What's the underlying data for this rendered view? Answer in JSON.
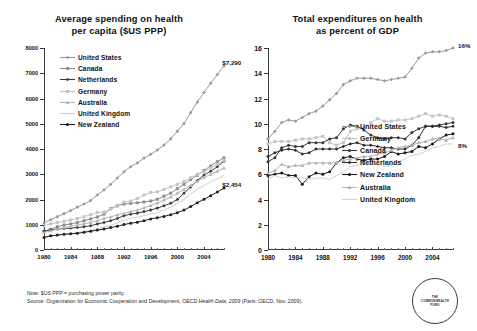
{
  "footnote": {
    "note": "Note: $US PPP = purchasing power parity.",
    "source_prefix": "Source: Organization for Economic Cooperation and Development, ",
    "source_italic": "OECD Health Data, 2009",
    "source_suffix": " (Paris: OECD, Nov. 2009)."
  },
  "logo": {
    "line1": "THE",
    "line2": "COMMONWEALTH",
    "line3": "FUND"
  },
  "chart_data": [
    {
      "id": "left",
      "type": "line",
      "title_line1": "Average spending on health",
      "title_line2": "per capita ($US PPP)",
      "xlabel": "",
      "ylabel": "",
      "xlim": [
        1980,
        2007
      ],
      "ylim": [
        0,
        8000
      ],
      "ytick_values": [
        0,
        1000,
        2000,
        3000,
        4000,
        5000,
        6000,
        7000,
        8000
      ],
      "ytick_labels": [
        "0",
        "1000",
        "2000",
        "3000",
        "4000",
        "5000",
        "6000",
        "7000",
        "8000"
      ],
      "xtick_values": [
        1980,
        1984,
        1988,
        1992,
        1996,
        2000,
        2004
      ],
      "xtick_labels": [
        "1980",
        "1984",
        "1988",
        "1992",
        "1996",
        "2000",
        "2004"
      ],
      "grid": false,
      "legend_position": "upper-left-inside",
      "annotations": [
        {
          "text": "$7,290",
          "x": 2006,
          "y": 7290
        },
        {
          "text": "$2,454",
          "x": 2006,
          "y": 2454
        }
      ],
      "x": [
        1980,
        1981,
        1982,
        1983,
        1984,
        1985,
        1986,
        1987,
        1988,
        1989,
        1990,
        1991,
        1992,
        1993,
        1994,
        1995,
        1996,
        1997,
        1998,
        1999,
        2000,
        2001,
        2002,
        2003,
        2004,
        2005,
        2006,
        2007
      ],
      "series": [
        {
          "name": "United States",
          "color": "#9a9a9a",
          "marker": "diamond",
          "values": [
            1072,
            1200,
            1320,
            1440,
            1560,
            1700,
            1820,
            1960,
            2180,
            2380,
            2600,
            2850,
            3100,
            3300,
            3450,
            3640,
            3790,
            3960,
            4160,
            4400,
            4700,
            5010,
            5440,
            5860,
            6240,
            6600,
            6950,
            7290
          ]
        },
        {
          "name": "Canada",
          "color": "#8e8e8e",
          "marker": "square",
          "values": [
            745,
            820,
            920,
            990,
            1030,
            1090,
            1160,
            1230,
            1310,
            1420,
            1640,
            1750,
            1820,
            1850,
            1870,
            1900,
            1940,
            2010,
            2130,
            2250,
            2430,
            2600,
            2790,
            2960,
            3150,
            3330,
            3500,
            3650
          ]
        },
        {
          "name": "Netherlands",
          "color": "#3c3c3c",
          "marker": "diamond",
          "values": [
            740,
            790,
            830,
            850,
            870,
            890,
            920,
            960,
            1030,
            1090,
            1160,
            1250,
            1360,
            1420,
            1460,
            1520,
            1580,
            1660,
            1750,
            1850,
            2000,
            2250,
            2500,
            2750,
            2970,
            3120,
            3300,
            3520
          ]
        },
        {
          "name": "Germany",
          "color": "#c4c4c4",
          "marker": "square",
          "values": [
            960,
            1040,
            1090,
            1140,
            1190,
            1250,
            1320,
            1400,
            1490,
            1500,
            1620,
            1740,
            1900,
            1940,
            2040,
            2180,
            2280,
            2300,
            2400,
            2500,
            2600,
            2720,
            2860,
            3000,
            3100,
            3250,
            3400,
            3550
          ]
        },
        {
          "name": "Australia",
          "color": "#b5b5b5",
          "marker": "triangle",
          "values": [
            690,
            760,
            830,
            890,
            930,
            990,
            1040,
            1090,
            1160,
            1250,
            1310,
            1390,
            1450,
            1520,
            1580,
            1670,
            1760,
            1860,
            1980,
            2100,
            2250,
            2400,
            2560,
            2720,
            2870,
            3000,
            3120,
            3250
          ]
        },
        {
          "name": "United Kingdom",
          "color": "#cfcfcf",
          "marker": "none",
          "values": [
            470,
            540,
            580,
            620,
            660,
            690,
            730,
            790,
            850,
            910,
            980,
            1070,
            1180,
            1250,
            1300,
            1360,
            1420,
            1480,
            1580,
            1700,
            1840,
            2010,
            2220,
            2400,
            2560,
            2700,
            2820,
            2950
          ]
        },
        {
          "name": "New Zealand",
          "color": "#202020",
          "marker": "circle",
          "values": [
            500,
            560,
            590,
            620,
            640,
            660,
            700,
            740,
            790,
            830,
            890,
            940,
            1010,
            1060,
            1100,
            1160,
            1230,
            1280,
            1330,
            1400,
            1480,
            1580,
            1720,
            1870,
            2010,
            2150,
            2300,
            2454
          ]
        }
      ]
    },
    {
      "id": "right",
      "type": "line",
      "title_line1": "Total expenditures on health",
      "title_line2": "as percent of GDP",
      "xlabel": "",
      "ylabel": "",
      "xlim": [
        1980,
        2007
      ],
      "ylim": [
        0,
        16
      ],
      "ytick_values": [
        0,
        2,
        4,
        6,
        8,
        10,
        12,
        14,
        16
      ],
      "ytick_labels": [
        "0",
        "2",
        "4",
        "6",
        "8",
        "10",
        "12",
        "14",
        "16"
      ],
      "xtick_values": [
        1980,
        1984,
        1988,
        1992,
        1996,
        2000,
        2004
      ],
      "xtick_labels": [
        "1980",
        "1984",
        "1988",
        "1992",
        "1996",
        "2000",
        "2004"
      ],
      "grid": false,
      "legend_position": "lower-right-inside",
      "annotations": [
        {
          "text": "16%",
          "x": 2007,
          "y": 15.9
        },
        {
          "text": "8%",
          "x": 2007,
          "y": 8.0
        }
      ],
      "x": [
        1980,
        1981,
        1982,
        1983,
        1984,
        1985,
        1986,
        1987,
        1988,
        1989,
        1990,
        1991,
        1992,
        1993,
        1994,
        1995,
        1996,
        1997,
        1998,
        1999,
        2000,
        2001,
        2002,
        2003,
        2004,
        2005,
        2006,
        2007
      ],
      "series": [
        {
          "name": "United States",
          "color": "#9a9a9a",
          "marker": "diamond",
          "values": [
            8.8,
            9.4,
            10.1,
            10.3,
            10.2,
            10.5,
            10.8,
            11.0,
            11.4,
            11.9,
            12.4,
            13.1,
            13.4,
            13.6,
            13.6,
            13.6,
            13.5,
            13.4,
            13.5,
            13.6,
            13.7,
            14.4,
            15.2,
            15.6,
            15.7,
            15.7,
            15.8,
            16.0
          ]
        },
        {
          "name": "Germany",
          "color": "#c4c4c4",
          "marker": "square",
          "values": [
            8.4,
            8.6,
            8.6,
            8.6,
            8.7,
            8.8,
            8.8,
            8.9,
            9.0,
            8.5,
            8.3,
            8.5,
            9.4,
            9.6,
            9.7,
            10.1,
            10.4,
            10.2,
            10.2,
            10.3,
            10.3,
            10.4,
            10.6,
            10.8,
            10.6,
            10.7,
            10.6,
            10.4
          ]
        },
        {
          "name": "Canada",
          "color": "#3a3a3a",
          "marker": "circle",
          "values": [
            7.0,
            7.3,
            8.1,
            8.3,
            8.2,
            8.2,
            8.5,
            8.5,
            8.5,
            8.8,
            8.9,
            9.6,
            9.9,
            9.8,
            9.5,
            9.1,
            8.9,
            8.8,
            8.9,
            8.9,
            8.8,
            9.3,
            9.6,
            9.8,
            9.8,
            9.9,
            10.0,
            10.1
          ]
        },
        {
          "name": "Netherlands",
          "color": "#2e2e2e",
          "marker": "diamond",
          "values": [
            7.4,
            7.7,
            7.9,
            8.0,
            7.9,
            7.6,
            7.7,
            8.0,
            8.0,
            8.0,
            8.0,
            8.2,
            8.4,
            8.5,
            8.3,
            8.3,
            8.2,
            8.1,
            8.1,
            8.0,
            8.0,
            8.3,
            8.9,
            9.8,
            9.8,
            9.8,
            9.7,
            9.8
          ]
        },
        {
          "name": "New Zealand",
          "color": "#1a1a1a",
          "marker": "circle",
          "values": [
            5.9,
            6.0,
            6.1,
            5.9,
            5.9,
            5.2,
            5.8,
            6.1,
            6.0,
            6.2,
            6.9,
            7.3,
            7.4,
            7.2,
            7.1,
            7.2,
            7.2,
            7.4,
            7.8,
            7.6,
            7.7,
            7.8,
            8.2,
            8.1,
            8.4,
            8.8,
            9.1,
            9.2
          ]
        },
        {
          "name": "Australia",
          "color": "#b2b2b2",
          "marker": "triangle",
          "values": [
            6.1,
            6.3,
            6.8,
            6.6,
            6.7,
            6.7,
            6.9,
            6.9,
            6.9,
            6.9,
            6.9,
            7.1,
            7.2,
            7.3,
            7.4,
            7.4,
            7.6,
            7.7,
            7.9,
            8.1,
            8.2,
            8.3,
            8.5,
            8.6,
            8.8,
            8.8,
            8.7,
            8.9
          ]
        },
        {
          "name": "United Kingdom",
          "color": "#d2d2d2",
          "marker": "none",
          "values": [
            5.6,
            5.9,
            5.7,
            5.8,
            5.7,
            5.7,
            5.6,
            5.7,
            5.7,
            5.6,
            5.9,
            6.2,
            6.6,
            6.7,
            6.8,
            6.8,
            6.8,
            6.6,
            6.7,
            7.0,
            7.2,
            7.5,
            7.6,
            7.8,
            8.1,
            8.2,
            8.4,
            8.4
          ]
        }
      ]
    }
  ]
}
